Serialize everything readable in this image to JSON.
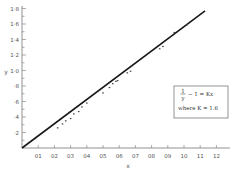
{
  "chart_data": {
    "type": "scatter",
    "title": "",
    "xlabel": "x",
    "ylabel": "y",
    "xlim": [
      0,
      1.25
    ],
    "ylim": [
      0,
      1.85
    ],
    "grid": false,
    "x_ticks": [
      0.1,
      0.2,
      0.3,
      0.4,
      0.5,
      0.6,
      0.7,
      0.8,
      0.9,
      1.0,
      1.1,
      1.2
    ],
    "x_tick_labels": [
      "01",
      "02",
      "03",
      "04",
      "05",
      "06",
      "07",
      "08",
      "09",
      "10",
      "11",
      "12"
    ],
    "y_ticks": [
      0.2,
      0.4,
      0.6,
      0.8,
      1.0,
      1.2,
      1.4,
      1.6,
      1.8
    ],
    "y_tick_labels": [
      "·2",
      "·4",
      "·6",
      "·8",
      "1·0",
      "1·2",
      "1·4",
      "1·6",
      "1·8"
    ],
    "series": [
      {
        "name": "measured",
        "kind": "scatter",
        "x": [
          0.22,
          0.25,
          0.27,
          0.3,
          0.32,
          0.35,
          0.37,
          0.4,
          0.5,
          0.54,
          0.56,
          0.58,
          0.59,
          0.65,
          0.67,
          0.85,
          0.87,
          0.94,
          1.02
        ],
        "y": [
          0.26,
          0.31,
          0.35,
          0.38,
          0.44,
          0.47,
          0.53,
          0.58,
          0.71,
          0.78,
          0.83,
          0.86,
          0.87,
          0.97,
          0.99,
          1.28,
          1.31,
          1.49,
          1.59
        ]
      },
      {
        "name": "fit: 1/y − 1 = Kx",
        "kind": "line",
        "x": [
          0,
          1.13
        ],
        "y": [
          0,
          1.77
        ]
      }
    ],
    "legend": {
      "position": "right-middle",
      "lines": [
        "1/y − 1 = Kx",
        "where K = 1.6"
      ]
    }
  },
  "title_text": "",
  "legend": {
    "equation_num": "1",
    "equation_den": "y",
    "equation_rest": "− 1 = Kx",
    "constant": "where K = 1.6"
  },
  "axes": {
    "xlabel": "x",
    "ylabel": "y"
  }
}
